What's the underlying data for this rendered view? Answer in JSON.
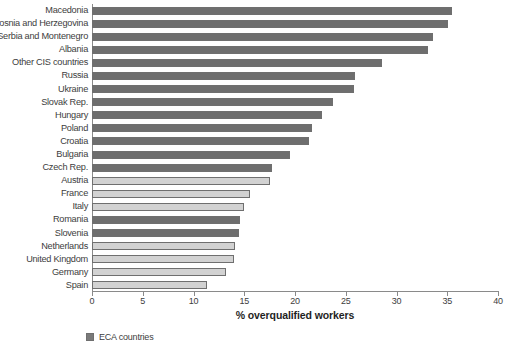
{
  "chart_data": {
    "type": "bar",
    "orientation": "horizontal",
    "title": "",
    "xlabel": "% overqualified workers",
    "ylabel": "",
    "xlim": [
      0,
      40
    ],
    "xticks": [
      0,
      5,
      10,
      15,
      20,
      25,
      30,
      35,
      40
    ],
    "grid": false,
    "legend": {
      "position": "bottom-left",
      "entries": [
        {
          "label": "ECA countries",
          "color": "#7a7a7a"
        }
      ]
    },
    "series_colors": {
      "eca": "#6e6e6e",
      "other": "#d2d2d2"
    },
    "categories": [
      "Macedonia",
      "Bosnia and Herzegovina",
      "Serbia and Montenegro",
      "Albania",
      "Other CIS countries",
      "Russia",
      "Ukraine",
      "Slovak Rep.",
      "Hungary",
      "Poland",
      "Croatia",
      "Bulgaria",
      "Czech Rep.",
      "Austria",
      "France",
      "Italy",
      "Romania",
      "Slovenia",
      "Netherlands",
      "United Kingdom",
      "Germany",
      "Spain"
    ],
    "values": [
      35.5,
      35.1,
      33.6,
      33.1,
      28.6,
      25.9,
      25.8,
      23.7,
      22.7,
      21.7,
      21.4,
      19.5,
      17.7,
      17.5,
      15.6,
      15.0,
      14.6,
      14.5,
      14.1,
      14.0,
      13.2,
      11.3
    ],
    "groups": [
      "eca",
      "eca",
      "eca",
      "eca",
      "eca",
      "eca",
      "eca",
      "eca",
      "eca",
      "eca",
      "eca",
      "eca",
      "eca",
      "other",
      "other",
      "other",
      "eca",
      "eca",
      "other",
      "other",
      "other",
      "other"
    ]
  }
}
